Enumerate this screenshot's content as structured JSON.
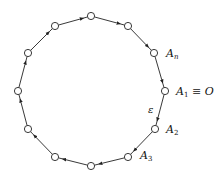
{
  "diagram": {
    "type": "directed-cycle",
    "node_radius": 3.6,
    "nodes": [
      {
        "id": "A1",
        "x": 165,
        "y": 91,
        "label": "A",
        "sub": "1",
        "suffix": " ≡ O",
        "lx": 176,
        "ly": 95
      },
      {
        "id": "A2",
        "x": 155,
        "y": 129,
        "label": "A",
        "sub": "2",
        "suffix": "",
        "lx": 166,
        "ly": 133
      },
      {
        "id": "A3",
        "x": 128,
        "y": 157,
        "label": "A",
        "sub": "3",
        "suffix": "",
        "lx": 140,
        "ly": 159
      },
      {
        "id": "B4",
        "x": 91,
        "y": 166,
        "label": "",
        "sub": "",
        "suffix": ""
      },
      {
        "id": "B5",
        "x": 55,
        "y": 157,
        "label": "",
        "sub": "",
        "suffix": ""
      },
      {
        "id": "B6",
        "x": 28,
        "y": 129,
        "label": "",
        "sub": "",
        "suffix": ""
      },
      {
        "id": "B7",
        "x": 18,
        "y": 91,
        "label": "",
        "sub": "",
        "suffix": ""
      },
      {
        "id": "B8",
        "x": 28,
        "y": 53,
        "label": "",
        "sub": "",
        "suffix": ""
      },
      {
        "id": "B9",
        "x": 55,
        "y": 26,
        "label": "",
        "sub": "",
        "suffix": ""
      },
      {
        "id": "B10",
        "x": 91,
        "y": 16,
        "label": "",
        "sub": "",
        "suffix": ""
      },
      {
        "id": "B11",
        "x": 128,
        "y": 26,
        "label": "",
        "sub": "",
        "suffix": ""
      },
      {
        "id": "An",
        "x": 154,
        "y": 53,
        "label": "A",
        "sub": "n",
        "suffix": "",
        "lx": 166,
        "ly": 57
      }
    ],
    "edge_label": {
      "text": "ε",
      "x": 148,
      "y": 113
    },
    "direction": "clockwise"
  }
}
